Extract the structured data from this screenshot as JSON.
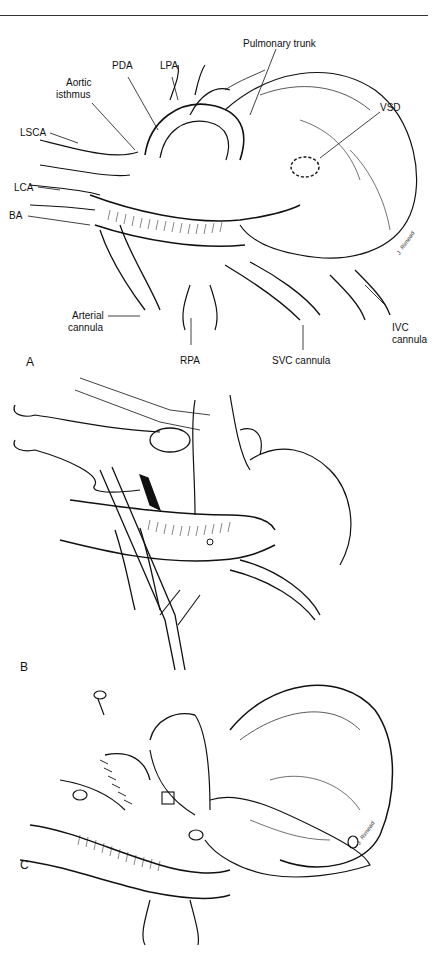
{
  "figure": {
    "panels": [
      {
        "letter": "A",
        "labels": {
          "pulmonary_trunk": "Pulmonary trunk",
          "pda": "PDA",
          "lpa": "LPA",
          "aortic_isthmus_1": "Aortic",
          "aortic_isthmus_2": "isthmus",
          "vsd": "VSD",
          "lsca": "LSCA",
          "lca": "LCA",
          "ba": "BA",
          "arterial_cannula_1": "Arterial",
          "arterial_cannula_2": "cannula",
          "rpa": "RPA",
          "svc_cannula": "SVC cannula",
          "ivc_cannula_1": "IVC",
          "ivc_cannula_2": "cannula"
        },
        "signature": "J. Rimead"
      },
      {
        "letter": "B"
      },
      {
        "letter": "C",
        "signature": "J. Rimead"
      }
    ],
    "colors": {
      "ink": "#111111",
      "background": "#ffffff"
    }
  }
}
